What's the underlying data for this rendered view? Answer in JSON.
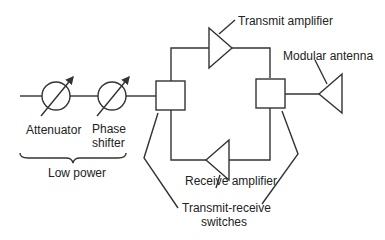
{
  "diagram": {
    "colors": {
      "line": "#333333",
      "text": "#222222",
      "background": "#ffffff"
    },
    "components": {
      "attenuator": {
        "label": "Attenuator",
        "icon": "variable-attenuator-circle"
      },
      "phase_shifter": {
        "label_line1": "Phase",
        "label_line2": "shifter",
        "icon": "variable-phase-shifter-circle"
      },
      "transmit_amplifier": {
        "label": "Transmit amplifier",
        "icon": "amplifier-triangle-right"
      },
      "receive_amplifier": {
        "label": "Receive amplifier",
        "icon": "amplifier-triangle-left"
      },
      "modular_antenna": {
        "label": "Modular antenna",
        "icon": "antenna-triangle"
      },
      "switches": {
        "label_line1": "Transmit-receive",
        "label_line2": "switches",
        "icon": "switch-box"
      }
    },
    "groups": {
      "low_power": {
        "label": "Low power"
      }
    }
  }
}
